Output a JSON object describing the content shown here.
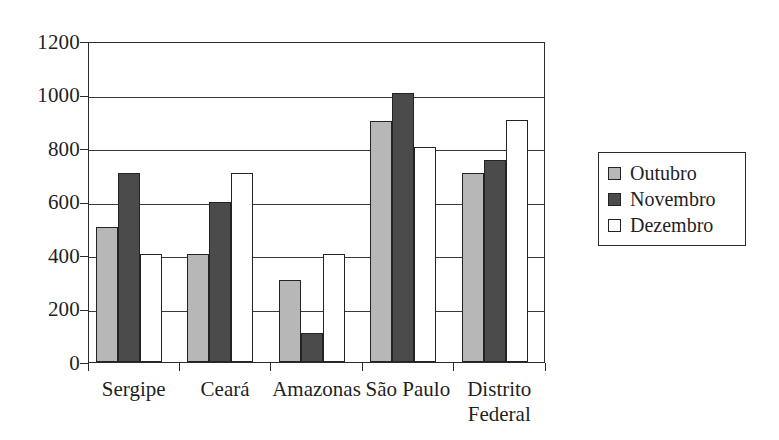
{
  "chart_data": {
    "type": "bar",
    "title": "",
    "xlabel": "",
    "ylabel": "",
    "ylim": [
      0,
      1200
    ],
    "yticks": [
      0,
      200,
      400,
      600,
      800,
      1000,
      1200
    ],
    "ytick_labels": [
      "0",
      "200",
      "400",
      "600",
      "800",
      "1000",
      "1200"
    ],
    "grid": "horizontal",
    "legend_position": "right-outside",
    "categories": [
      "Sergipe",
      "Ceará",
      "Amazonas",
      "São Paulo",
      "Distrito\nFederal"
    ],
    "series": [
      {
        "name": "Outubro",
        "color": "#b7b7b7",
        "values": [
          505,
          405,
          305,
          900,
          705
        ]
      },
      {
        "name": "Novembro",
        "color": "#4b4b4b",
        "values": [
          705,
          600,
          110,
          1005,
          755
        ]
      },
      {
        "name": "Dezembro",
        "color": "#ffffff",
        "values": [
          405,
          705,
          405,
          805,
          905
        ]
      }
    ]
  },
  "legend": {
    "items": [
      {
        "label": "Outubro",
        "swatch": "legend-swatch-outubro"
      },
      {
        "label": "Novembro",
        "swatch": "legend-swatch-novembro"
      },
      {
        "label": "Dezembro",
        "swatch": "legend-swatch-dezembro"
      }
    ]
  },
  "axis": {
    "y_labels": [
      "1200",
      "1000",
      "800",
      "600",
      "400",
      "200",
      "0"
    ]
  }
}
